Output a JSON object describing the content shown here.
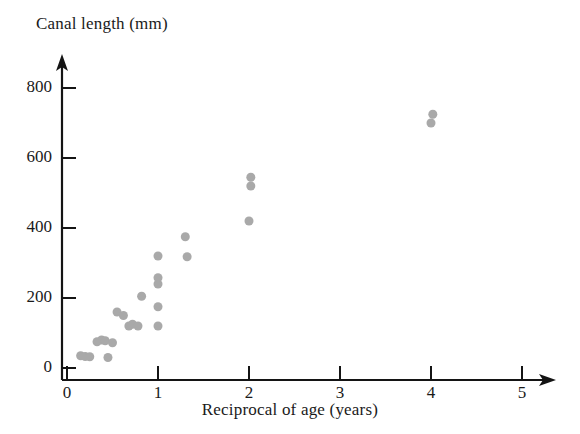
{
  "chart_data": {
    "type": "scatter",
    "title": "",
    "xlabel": "Reciprocal of age (years)",
    "ylabel": "Canal length (mm)",
    "xlim": [
      0,
      5.4
    ],
    "ylim": [
      0,
      880
    ],
    "xticks": [
      0,
      1,
      2,
      3,
      4,
      5
    ],
    "xtick_labels": [
      "0",
      "1",
      "2",
      "3",
      "4",
      "5"
    ],
    "yticks": [
      0,
      200,
      400,
      600,
      800
    ],
    "ytick_labels": [
      "0",
      "200",
      "400",
      "600",
      "800"
    ],
    "grid": false,
    "legend": null,
    "marker_color": "#a9a9a9",
    "marker_size": 9,
    "points": [
      {
        "x": 0.15,
        "y": 35
      },
      {
        "x": 0.2,
        "y": 33
      },
      {
        "x": 0.25,
        "y": 32
      },
      {
        "x": 0.33,
        "y": 75
      },
      {
        "x": 0.38,
        "y": 80
      },
      {
        "x": 0.42,
        "y": 78
      },
      {
        "x": 0.45,
        "y": 30
      },
      {
        "x": 0.5,
        "y": 72
      },
      {
        "x": 0.55,
        "y": 160
      },
      {
        "x": 0.62,
        "y": 150
      },
      {
        "x": 0.68,
        "y": 120
      },
      {
        "x": 0.72,
        "y": 125
      },
      {
        "x": 0.78,
        "y": 120
      },
      {
        "x": 0.82,
        "y": 205
      },
      {
        "x": 1.0,
        "y": 120
      },
      {
        "x": 1.0,
        "y": 175
      },
      {
        "x": 1.0,
        "y": 240
      },
      {
        "x": 1.0,
        "y": 258
      },
      {
        "x": 1.0,
        "y": 320
      },
      {
        "x": 1.3,
        "y": 375
      },
      {
        "x": 1.32,
        "y": 318
      },
      {
        "x": 2.0,
        "y": 420
      },
      {
        "x": 2.02,
        "y": 520
      },
      {
        "x": 2.02,
        "y": 545
      },
      {
        "x": 4.0,
        "y": 700
      },
      {
        "x": 4.02,
        "y": 725
      }
    ]
  },
  "axes": {
    "y_arrow": "up-arrow",
    "x_arrow": "right-arrow"
  }
}
